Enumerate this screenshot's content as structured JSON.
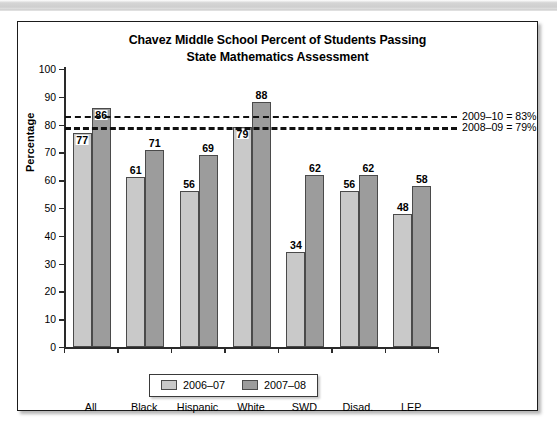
{
  "chart_data": {
    "type": "bar",
    "title": "Chavez Middle School Percent of Students Passing State Mathematics Assessment",
    "title_line1": "Chavez Middle School Percent of Students Passing",
    "title_line2": "State Mathematics Assessment",
    "xlabel": "",
    "ylabel": "Percentage",
    "ylim": [
      0,
      100
    ],
    "ytick_step": 10,
    "yticks": [
      0,
      10,
      20,
      30,
      40,
      50,
      60,
      70,
      80,
      90,
      100
    ],
    "grid": false,
    "legend_position": "bottom-center",
    "categories": [
      "All",
      "Black",
      "Hispanic",
      "White",
      "SWD",
      "Disad.",
      "LEP"
    ],
    "series": [
      {
        "name": "2006–07",
        "color": "#c9c9c9",
        "values": [
          77,
          61,
          56,
          79,
          34,
          56,
          48
        ]
      },
      {
        "name": "2007–08",
        "color": "#9c9c9c",
        "values": [
          86,
          71,
          69,
          88,
          62,
          62,
          58
        ]
      }
    ],
    "reference_lines": [
      {
        "id": "a",
        "label": "2009–10 = 83%",
        "value": 83,
        "dash": "short"
      },
      {
        "id": "b",
        "label": "2008–09 = 79%",
        "value": 79,
        "dash": "long"
      }
    ]
  },
  "legend": {
    "items": [
      {
        "label": "2006–07"
      },
      {
        "label": "2007–08"
      }
    ]
  }
}
